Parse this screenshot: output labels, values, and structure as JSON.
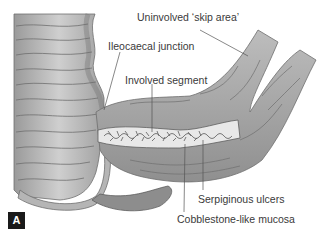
{
  "figure": {
    "panel_label": "A",
    "labels": {
      "skip_area": "Uninvolved ‘skip area’",
      "ileocaecal": "Ileocaecal junction",
      "involved": "Involved segment",
      "ulcers": "Serpiginous ulcers",
      "cobblestone": "Cobblestone-like mucosa"
    },
    "colors": {
      "tissue": "#a8a8a8",
      "tissue_dark": "#7e7e7e",
      "mucosa": "#e8e8e8",
      "text": "#3a3a3a",
      "leader": "#555555"
    }
  }
}
